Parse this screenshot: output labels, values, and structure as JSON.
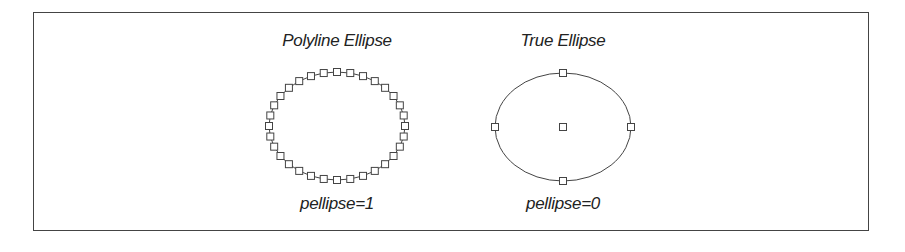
{
  "figure": {
    "left": {
      "title": "Polyline Ellipse",
      "caption": "pellipse=1",
      "center": [
        337,
        126
      ],
      "rx": 68,
      "ry": 54,
      "vertex_count": 32
    },
    "right": {
      "title": "True Ellipse",
      "caption": "pellipse=0",
      "center": [
        563,
        127
      ],
      "rx": 68,
      "ry": 54
    },
    "colors": {
      "stroke": "#444444",
      "text": "#222222",
      "border": "#444444"
    }
  }
}
